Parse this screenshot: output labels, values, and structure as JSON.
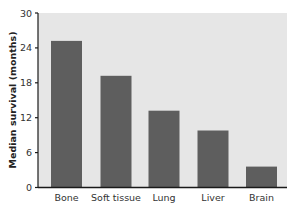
{
  "chart_data": {
    "type": "bar",
    "title": "",
    "xlabel": "",
    "ylabel": "Median survival (months)",
    "categories": [
      "Bone",
      "Soft tissue",
      "Lung",
      "Liver",
      "Brain"
    ],
    "values": [
      25.2,
      19.2,
      13.2,
      9.8,
      3.6
    ],
    "ylim": [
      0,
      30
    ],
    "yticks": [
      0,
      6,
      12,
      18,
      24,
      30
    ],
    "grid": false,
    "legend": null,
    "colors": {
      "bar": "#5e5e5e",
      "plot_background": "#e6e6e6",
      "axis": "#1a1a1a"
    }
  }
}
